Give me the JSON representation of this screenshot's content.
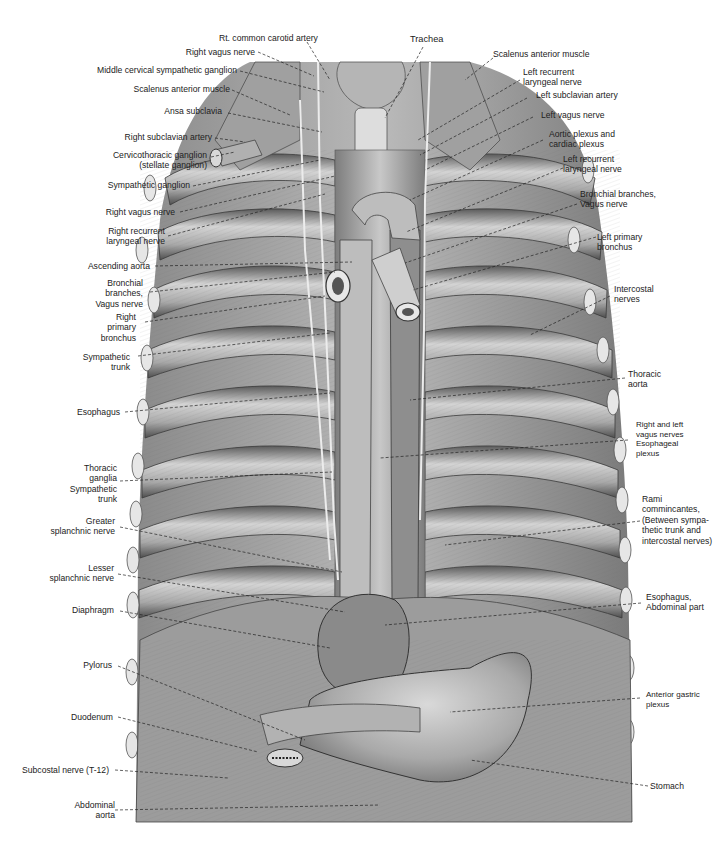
{
  "figure": {
    "colors": {
      "background": "#ffffff",
      "illustration_base": "#9a9a9a",
      "illustration_light": "#d8d8d8",
      "illustration_dark": "#4a4a4a",
      "leader_line": "#222222",
      "label_text": "#222222"
    }
  },
  "labels_top": [
    {
      "id": "rt-common-carotid-artery",
      "lines": [
        "Rt. common carotid artery"
      ]
    },
    {
      "id": "trachea",
      "lines": [
        "Trachea"
      ]
    }
  ],
  "labels_left": [
    {
      "id": "right-vagus-nerve-upper",
      "lines": [
        "Right vagus nerve"
      ]
    },
    {
      "id": "middle-cervical-sympathetic-ganglion",
      "lines": [
        "Middle cervical sympathetic ganglion"
      ]
    },
    {
      "id": "scalenus-anterior-muscle-right",
      "lines": [
        "Scalenus anterior muscle"
      ]
    },
    {
      "id": "ansa-subclavia",
      "lines": [
        "Ansa subclavia"
      ]
    },
    {
      "id": "right-subclavian-artery",
      "lines": [
        "Right subclavian artery"
      ]
    },
    {
      "id": "cervicothoracic-ganglion",
      "lines": [
        "Cervicothoracic ganglion",
        "(stellate ganglion)"
      ]
    },
    {
      "id": "sympathetic-ganglion",
      "lines": [
        "Sympathetic ganglion"
      ]
    },
    {
      "id": "right-vagus-nerve-lower",
      "lines": [
        "Right vagus nerve"
      ]
    },
    {
      "id": "right-recurrent-laryngeal-nerve",
      "lines": [
        "Right recurrent",
        "laryngeal nerve"
      ]
    },
    {
      "id": "ascending-aorta",
      "lines": [
        "Ascending aorta"
      ]
    },
    {
      "id": "bronchial-branches-vagus-right",
      "lines": [
        "Bronchial",
        "branches,",
        "Vagus nerve"
      ]
    },
    {
      "id": "right-primary-bronchus",
      "lines": [
        "Right",
        "primary",
        "bronchus"
      ]
    },
    {
      "id": "sympathetic-trunk",
      "lines": [
        "Sympathetic",
        "trunk"
      ]
    },
    {
      "id": "esophagus",
      "lines": [
        "Esophagus"
      ]
    },
    {
      "id": "thoracic-ganglia",
      "lines": [
        "Thoracic",
        "ganglia",
        "Sympathetic",
        "trunk"
      ]
    },
    {
      "id": "greater-splanchnic-nerve",
      "lines": [
        "Greater",
        "splanchnic nerve"
      ]
    },
    {
      "id": "lesser-splanchnic-nerve",
      "lines": [
        "Lesser",
        "splanchnic nerve"
      ]
    },
    {
      "id": "diaphragm",
      "lines": [
        "Diaphragm"
      ]
    },
    {
      "id": "pylorus",
      "lines": [
        "Pylorus"
      ]
    },
    {
      "id": "duodenum",
      "lines": [
        "Duodenum"
      ]
    },
    {
      "id": "subcostal-nerve",
      "lines": [
        "Subcostal nerve (T-12)"
      ]
    },
    {
      "id": "abdominal-aorta",
      "lines": [
        "Abdominal",
        "aorta"
      ]
    }
  ],
  "labels_right": [
    {
      "id": "scalenus-anterior-muscle-left",
      "lines": [
        "Scalenus anterior muscle"
      ]
    },
    {
      "id": "left-recurrent-laryngeal-nerve-upper",
      "lines": [
        "Left recurrent",
        "laryngeal nerve"
      ]
    },
    {
      "id": "left-subclavian-artery",
      "lines": [
        "Left subclavian artery"
      ]
    },
    {
      "id": "left-vagus-nerve",
      "lines": [
        "Left vagus nerve"
      ]
    },
    {
      "id": "aortic-plexus",
      "lines": [
        "Aortic plexus and",
        "cardiac plexus"
      ]
    },
    {
      "id": "left-recurrent-laryngeal-nerve-lower",
      "lines": [
        "Left recurrent",
        "laryngeal nerve"
      ]
    },
    {
      "id": "bronchial-branches-vagus-left",
      "lines": [
        "Bronchial branches,",
        "Vagus nerve"
      ]
    },
    {
      "id": "left-primary-bronchus",
      "lines": [
        "Left primary",
        "bronchus"
      ]
    },
    {
      "id": "intercostal-nerves",
      "lines": [
        "Intercostal",
        "nerves"
      ]
    },
    {
      "id": "thoracic-aorta",
      "lines": [
        "Thoracic",
        "aorta"
      ]
    },
    {
      "id": "esophageal-plexus",
      "lines": [
        "Right and left",
        "vagus nerves",
        "Esophageal",
        "plexus"
      ]
    },
    {
      "id": "rami-communicantes",
      "lines": [
        "Rami",
        "commincantes,",
        "(Between sympa-",
        "thetic trunk and",
        "intercostal nerves)"
      ]
    },
    {
      "id": "esophagus-abdominal-part",
      "lines": [
        "Esophagus,",
        "Abdominal part"
      ]
    },
    {
      "id": "anterior-gastric-plexus",
      "lines": [
        "Anterior gastric",
        "plexus"
      ]
    },
    {
      "id": "stomach",
      "lines": [
        "Stomach"
      ]
    }
  ]
}
